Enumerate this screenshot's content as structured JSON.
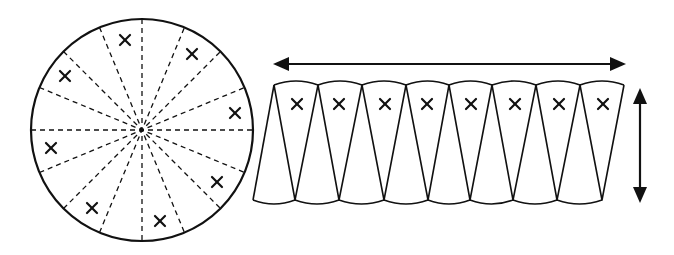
{
  "diagram": {
    "title": "Circle divided into 16 sectors rearranged into an approximate parallelogram",
    "circle": {
      "center": [
        142,
        130
      ],
      "radius": 111,
      "sector_count": 16,
      "marked_sectors": 8,
      "mark_symbol": "×",
      "marks": [
        [
          125,
          40
        ],
        [
          192,
          54
        ],
        [
          235,
          113
        ],
        [
          217,
          182
        ],
        [
          160,
          221
        ],
        [
          92,
          208
        ],
        [
          51,
          148
        ],
        [
          65,
          76
        ]
      ]
    },
    "rearranged": {
      "top_vertices_x": [
        274,
        318,
        362,
        406,
        449,
        492,
        536,
        580,
        624
      ],
      "bottom_vertices_x": [
        253,
        295,
        339,
        384,
        428,
        470,
        513,
        557,
        602
      ],
      "top_y": 85,
      "bottom_y": 200,
      "mark_y": 104,
      "marks_x": [
        297,
        339,
        385,
        427,
        471,
        515,
        559,
        603
      ],
      "mark_symbol": "×"
    },
    "arrows": {
      "horizontal": {
        "x1": 273,
        "x2": 626,
        "y": 64,
        "meaning": "length (half circumference)"
      },
      "vertical": {
        "x": 640,
        "y1": 88,
        "y2": 203,
        "meaning": "height (radius)"
      }
    },
    "colors": {
      "ink": "#111111",
      "background": "#ffffff"
    }
  }
}
